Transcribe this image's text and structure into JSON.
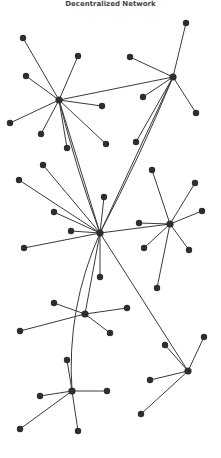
{
  "title": "Decentralized Network",
  "colors": {
    "edge": "#3a3a3a",
    "node": "#2e2e2e",
    "background": "#ffffff"
  },
  "hubs": [
    {
      "id": "h1",
      "x": 59,
      "y": 100,
      "leaves": [
        [
          23,
          38
        ],
        [
          78,
          56
        ],
        [
          26,
          76
        ],
        [
          10,
          123
        ],
        [
          41,
          134
        ],
        [
          67,
          148
        ],
        [
          106,
          144
        ],
        [
          102,
          106
        ]
      ]
    },
    {
      "id": "h2",
      "x": 173,
      "y": 77,
      "leaves": [
        [
          186,
          23
        ],
        [
          130,
          57
        ],
        [
          143,
          97
        ],
        [
          196,
          113
        ],
        [
          136,
          142
        ]
      ]
    },
    {
      "id": "h3",
      "x": 100,
      "y": 233,
      "leaves": [
        [
          43,
          165
        ],
        [
          19,
          180
        ],
        [
          54,
          212
        ],
        [
          71,
          231
        ],
        [
          24,
          248
        ],
        [
          104,
          197
        ],
        [
          100,
          277
        ]
      ]
    },
    {
      "id": "h4",
      "x": 170,
      "y": 224,
      "leaves": [
        [
          152,
          170
        ],
        [
          195,
          183
        ],
        [
          202,
          211
        ],
        [
          139,
          223
        ],
        [
          144,
          248
        ],
        [
          189,
          250
        ],
        [
          157,
          288
        ]
      ]
    },
    {
      "id": "h5",
      "x": 85,
      "y": 314,
      "leaves": [
        [
          54,
          303
        ],
        [
          20,
          331
        ],
        [
          127,
          308
        ],
        [
          110,
          333
        ]
      ]
    },
    {
      "id": "h6",
      "x": 72,
      "y": 391,
      "leaves": [
        [
          67,
          360
        ],
        [
          40,
          396
        ],
        [
          107,
          391
        ],
        [
          20,
          429
        ],
        [
          78,
          431
        ]
      ]
    },
    {
      "id": "h7",
      "x": 188,
      "y": 371,
      "leaves": [
        [
          165,
          345
        ],
        [
          204,
          337
        ],
        [
          150,
          380
        ],
        [
          141,
          414
        ]
      ]
    }
  ],
  "hub_links": [
    {
      "from": "h1",
      "to": "h2",
      "curve": 0
    },
    {
      "from": "h1",
      "to": "h3",
      "curve": 0
    },
    {
      "from": "h1",
      "to": "h3",
      "curve": 4
    },
    {
      "from": "h2",
      "to": "h3",
      "curve": 0
    },
    {
      "from": "h2",
      "to": "h3",
      "curve": -4
    },
    {
      "from": "h3",
      "to": "h4",
      "curve": 0
    },
    {
      "from": "h3",
      "to": "h5",
      "curve": 0
    },
    {
      "from": "h3",
      "to": "h6",
      "curve": 20
    },
    {
      "from": "h3",
      "to": "h7",
      "curve": 0
    }
  ]
}
